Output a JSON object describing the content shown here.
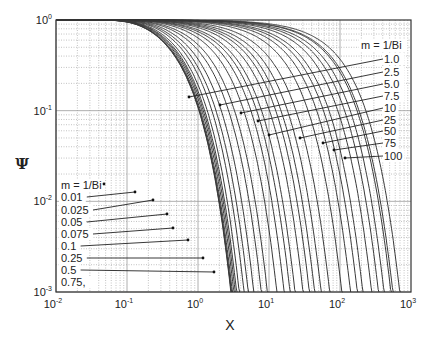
{
  "chart_data": {
    "type": "line",
    "title": "",
    "xlabel": "X",
    "ylabel": "Ψ",
    "xscale": "log",
    "yscale": "log",
    "xlim": [
      0.01,
      1000
    ],
    "ylim": [
      0.001,
      1
    ],
    "grid": true,
    "x_ticks": [
      {
        "base": "10",
        "exp": "-2"
      },
      {
        "base": "10",
        "exp": "-1"
      },
      {
        "base": "10",
        "exp": "0"
      },
      {
        "base": "10",
        "exp": "1"
      },
      {
        "base": "10",
        "exp": "2"
      },
      {
        "base": "10",
        "exp": "3"
      }
    ],
    "y_ticks": [
      {
        "base": "10",
        "exp": "0"
      },
      {
        "base": "10",
        "exp": "-1"
      },
      {
        "base": "10",
        "exp": "-2"
      },
      {
        "base": "10",
        "exp": "-3"
      }
    ],
    "parameter": "m = 1/Bi",
    "series": [
      {
        "name": "0.01",
        "m": 0.01
      },
      {
        "name": "0.025",
        "m": 0.025
      },
      {
        "name": "0.05",
        "m": 0.05
      },
      {
        "name": "0.075",
        "m": 0.075
      },
      {
        "name": "0.1",
        "m": 0.1
      },
      {
        "name": "0.25",
        "m": 0.25
      },
      {
        "name": "0.5",
        "m": 0.5
      },
      {
        "name": "0.75",
        "m": 0.75
      },
      {
        "name": "1.0",
        "m": 1.0
      },
      {
        "name": "2.5",
        "m": 2.5
      },
      {
        "name": "5.0",
        "m": 5.0
      },
      {
        "name": "7.5",
        "m": 7.5
      },
      {
        "name": "10",
        "m": 10
      },
      {
        "name": "25",
        "m": 25
      },
      {
        "name": "50",
        "m": 50
      },
      {
        "name": "75",
        "m": 75
      },
      {
        "name": "100",
        "m": 100
      }
    ],
    "extra_curves_m": [
      0.0,
      0.005,
      0.15,
      0.35,
      1.5,
      2.0,
      3.0,
      4.0,
      6.0,
      15,
      20,
      30,
      40,
      60,
      80
    ],
    "annotations": {
      "left_group": {
        "header": "m = 1/Bi",
        "labels": [
          "0.01",
          "0.025",
          "0.05",
          "0.075",
          "0.1",
          "0.25",
          "0.5",
          "0.75,"
        ]
      },
      "right_group": {
        "header": "m = 1/Bi",
        "labels": [
          "1.0",
          "2.5",
          "5.0",
          "7.5",
          "10",
          "25",
          "50",
          "75",
          "100"
        ]
      }
    }
  },
  "layout": {
    "frame": {
      "left": 56,
      "top": 20,
      "right": 411,
      "bottom": 292
    },
    "left_labels": [
      {
        "text_key": 0,
        "x": 61,
        "y": 201,
        "tx": 104,
        "ty": 184
      },
      {
        "text_key": 1,
        "x": 61,
        "y": 214,
        "tx": 135,
        "ty": 192
      },
      {
        "text_key": 2,
        "x": 61,
        "y": 226,
        "tx": 153,
        "ty": 200
      },
      {
        "text_key": 3,
        "x": 61,
        "y": 238,
        "tx": 167,
        "ty": 214
      },
      {
        "text_key": 4,
        "x": 61,
        "y": 250,
        "tx": 173,
        "ty": 228
      },
      {
        "text_key": 5,
        "x": 61,
        "y": 262,
        "tx": 188,
        "ty": 240
      },
      {
        "text_key": 6,
        "x": 61,
        "y": 274,
        "tx": 203,
        "ty": 258
      },
      {
        "text_key": 7,
        "x": 61,
        "y": 286,
        "tx": 214,
        "ty": 272
      }
    ],
    "left_header": {
      "x": 61,
      "y": 189
    },
    "right_header": {
      "x": 361,
      "y": 49
    },
    "right_labels": [
      {
        "x": 384,
        "y": 63,
        "tx": 189,
        "ty": 97
      },
      {
        "x": 384,
        "y": 76,
        "tx": 220,
        "ty": 105
      },
      {
        "x": 384,
        "y": 88,
        "tx": 241,
        "ty": 113
      },
      {
        "x": 384,
        "y": 100,
        "tx": 258,
        "ty": 121
      },
      {
        "x": 384,
        "y": 112,
        "tx": 269,
        "ty": 135
      },
      {
        "x": 384,
        "y": 124,
        "tx": 300,
        "ty": 138
      },
      {
        "x": 384,
        "y": 135,
        "tx": 323,
        "ty": 143
      },
      {
        "x": 384,
        "y": 147,
        "tx": 334,
        "ty": 150
      },
      {
        "x": 384,
        "y": 160,
        "tx": 345,
        "ty": 158
      }
    ],
    "colors": {
      "curve": "#3a3a3a",
      "grid": "#9a9a9a",
      "frame": "#333333",
      "text": "#222222"
    }
  }
}
